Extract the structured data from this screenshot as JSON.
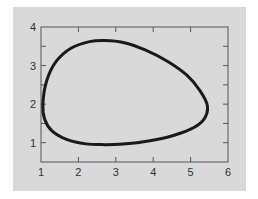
{
  "chart_data": {
    "type": "line",
    "title": "",
    "xlabel": "",
    "ylabel": "",
    "xlim": [
      1,
      6
    ],
    "ylim": [
      0.5,
      4
    ],
    "x_ticks": [
      "1",
      "2",
      "3",
      "4",
      "5",
      "6"
    ],
    "y_ticks": [
      "1",
      "2",
      "3",
      "4"
    ],
    "grid": false,
    "legend": null,
    "series": [
      {
        "name": "closed orbit",
        "closed": true,
        "color": "#1a1a1a",
        "x": [
          1.05,
          1.15,
          1.4,
          1.8,
          2.3,
          2.7,
          3.2,
          3.8,
          4.4,
          4.9,
          5.25,
          5.45,
          5.35,
          5.0,
          4.4,
          3.7,
          3.1,
          2.7,
          2.2,
          1.7,
          1.3,
          1.1,
          1.05
        ],
        "y": [
          2.0,
          2.6,
          3.1,
          3.45,
          3.62,
          3.65,
          3.6,
          3.4,
          3.1,
          2.75,
          2.35,
          1.95,
          1.6,
          1.35,
          1.15,
          1.02,
          0.96,
          0.95,
          0.97,
          1.08,
          1.3,
          1.6,
          2.0
        ]
      }
    ]
  },
  "axes": {
    "x_labels": [
      "1",
      "2",
      "3",
      "4",
      "5",
      "6"
    ],
    "y_labels": [
      "1",
      "2",
      "3",
      "4"
    ]
  }
}
